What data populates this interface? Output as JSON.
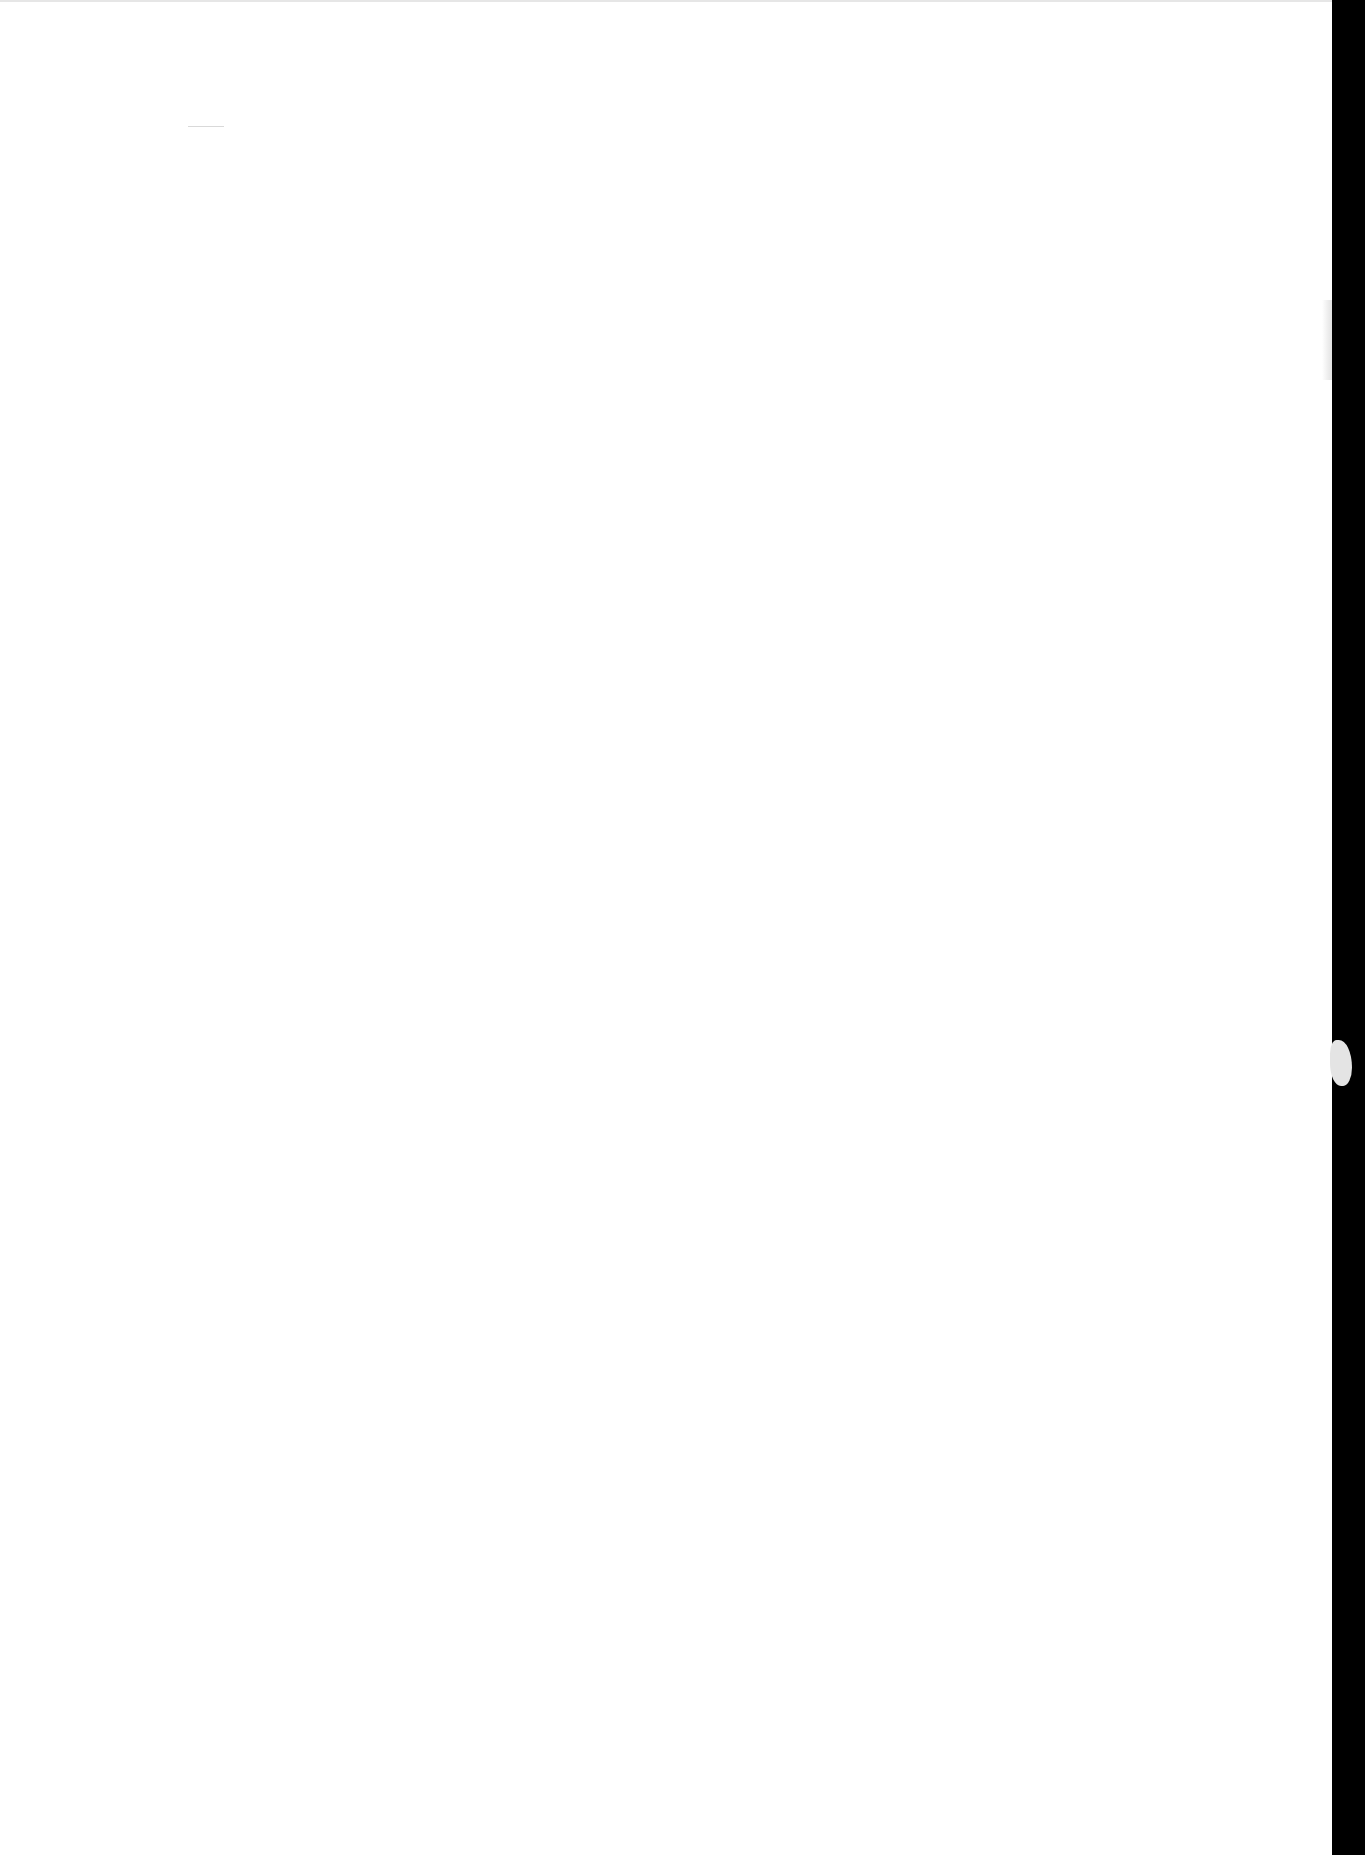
{
  "document": {
    "type": "blank scanned page",
    "bleed_through_lines": [
      "",
      "",
      ""
    ]
  },
  "colors": {
    "page": "#ffffff",
    "scanner_background": "#000000"
  }
}
